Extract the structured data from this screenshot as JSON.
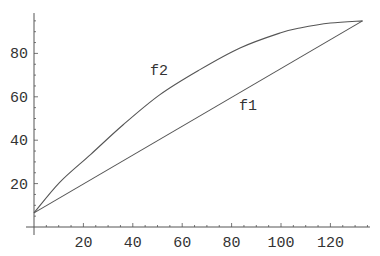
{
  "chart_data": {
    "type": "line",
    "title": "",
    "xlabel": "",
    "ylabel": "",
    "xlim": [
      0,
      136
    ],
    "ylim": [
      0,
      98.6
    ],
    "x_ticks": [
      20,
      40,
      60,
      80,
      100,
      120
    ],
    "y_ticks": [
      20,
      40,
      60,
      80
    ],
    "x_minor_step": 5,
    "y_minor_step": 5,
    "grid": false,
    "legend": "none",
    "series": [
      {
        "name": "f1",
        "label_pos": [
          83,
          54
        ],
        "x": [
          0,
          133
        ],
        "values": [
          6.5,
          95
        ]
      },
      {
        "name": "f2",
        "label_pos": [
          47,
          70
        ],
        "x": [
          0,
          10.5,
          23,
          36,
          51,
          67,
          83.4,
          99.6,
          107.7,
          120,
          133
        ],
        "values": [
          6.5,
          20.7,
          33.5,
          47,
          61,
          72.4,
          82.5,
          89.4,
          91.7,
          94,
          95
        ]
      }
    ],
    "annotations": [
      {
        "text": "f1",
        "x": 83,
        "y": 54
      },
      {
        "text": "f2",
        "x": 47,
        "y": 70
      }
    ]
  },
  "plot": {
    "origin_px": [
      34,
      227
    ],
    "px_per_x": 2.47,
    "px_per_y": 2.17,
    "colors": {
      "line": "#555555",
      "text": "#333333",
      "background": "#ffffff"
    }
  }
}
